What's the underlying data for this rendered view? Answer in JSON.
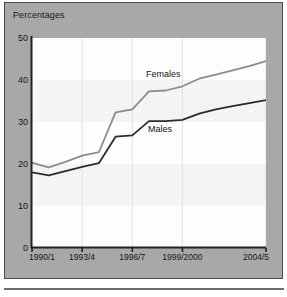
{
  "figure": {
    "title": "Percentages",
    "panel_color": "#a8a8a8",
    "plot_background": "#fdfdfd",
    "border_color": "#4a4a4a"
  },
  "chart_data": {
    "type": "line",
    "title": "Percentages",
    "xlabel": "",
    "ylabel": "",
    "ylim": [
      0,
      50
    ],
    "yticks": [
      0,
      10,
      20,
      30,
      40,
      50
    ],
    "ytick_labels": [
      "0",
      "10",
      "20",
      "30",
      "40",
      "50"
    ],
    "x": [
      "1990/1",
      "1991/2",
      "1992/3",
      "1993/4",
      "1994/5",
      "1995/6",
      "1996/7",
      "1997/8",
      "1998/9",
      "1999/2000",
      "2000/1",
      "2001/2",
      "2002/3",
      "2003/4",
      "2004/5"
    ],
    "xtick_labels": [
      "1990/1",
      "1993/4",
      "1996/7",
      "1999/2000",
      "2004/5"
    ],
    "xtick_positions": [
      0,
      3,
      6,
      9,
      14
    ],
    "grid": "vertical gridlines at x ticks; faint alternating horizontal bands",
    "legend": "inline series labels",
    "series": [
      {
        "name": "Females",
        "color": "#8c8c8c",
        "label_position": "inline-above-line",
        "values": [
          20.3,
          19.2,
          20.5,
          22.0,
          22.8,
          32.3,
          33.0,
          37.3,
          37.5,
          38.5,
          40.3,
          41.3,
          42.3,
          43.3,
          44.5
        ]
      },
      {
        "name": "Males",
        "color": "#2b2b2b",
        "label_position": "inline-below-line",
        "values": [
          18.0,
          17.3,
          18.3,
          19.3,
          20.2,
          26.5,
          26.8,
          30.2,
          30.2,
          30.5,
          32.0,
          33.0,
          33.8,
          34.5,
          35.2
        ]
      }
    ]
  }
}
